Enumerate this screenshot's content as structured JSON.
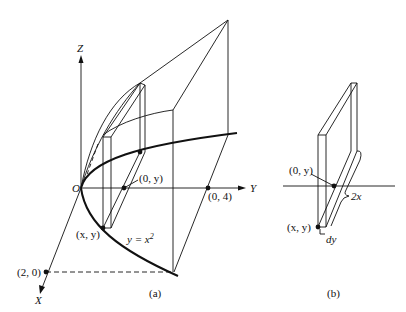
{
  "figure": {
    "panel_a": {
      "caption": "(a)",
      "axes": {
        "x": "X",
        "y": "Y",
        "z": "Z"
      },
      "origin_label": "O",
      "points": {
        "zero_y": "(0, y)",
        "zero_four": "(0, 4)",
        "x_y": "(x, y)",
        "two_zero": "(2, 0)"
      },
      "curve_label_base": "y = x",
      "curve_label_exp": "2"
    },
    "panel_b": {
      "caption": "(b)",
      "points": {
        "zero_y": "(0, y)",
        "x_y": "(x, y)"
      },
      "width_label": "2x",
      "thickness_label": "dy"
    },
    "colors": {
      "ink": "#111111",
      "background": "#ffffff"
    }
  }
}
